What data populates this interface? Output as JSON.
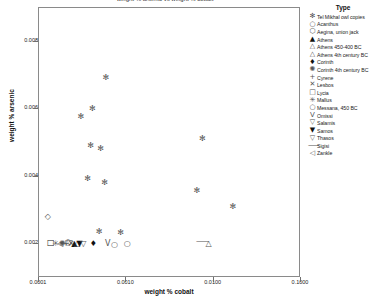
{
  "chart_data": {
    "type": "scatter",
    "title": "weight % arsenic vs weight % cobalt",
    "xlabel": "weight % cobalt",
    "ylabel": "weight % arsenic",
    "xscale": "log",
    "yscale": "linear",
    "xlim": [
      0.0001,
      0.1
    ],
    "ylim": [
      0.001,
      0.009
    ],
    "grid": false,
    "legend_position": "right",
    "legend_title": "Type",
    "xticks": [
      "0.0001",
      "0.0010",
      "0.0100",
      "0.1000"
    ],
    "xtick_values": [
      0.0001,
      0.001,
      0.01,
      0.1
    ],
    "yticks": [
      "0.008",
      "0.006",
      "0.004",
      "0.002"
    ],
    "ytick_values": [
      0.008,
      0.006,
      0.004,
      0.002
    ],
    "series": [
      {
        "name": "Tel Mikhal owl copies",
        "symbol": "✻",
        "dark": false,
        "points": [
          {
            "x": 0.0006,
            "y": 0.0069
          },
          {
            "x": 0.00042,
            "y": 0.006
          },
          {
            "x": 0.00031,
            "y": 0.00575
          },
          {
            "x": 0.0004,
            "y": 0.0049
          },
          {
            "x": 0.00052,
            "y": 0.0048
          },
          {
            "x": 0.00037,
            "y": 0.00392
          },
          {
            "x": 0.00058,
            "y": 0.0038
          },
          {
            "x": 0.0076,
            "y": 0.0051
          },
          {
            "x": 0.0066,
            "y": 0.00355
          },
          {
            "x": 0.017,
            "y": 0.0031
          },
          {
            "x": 0.0005,
            "y": 0.00235
          },
          {
            "x": 0.00088,
            "y": 0.00232
          }
        ]
      },
      {
        "name": "Acanthus",
        "symbol": "○",
        "dark": false,
        "points": [
          {
            "x": 0.00105,
            "y": 0.00198
          }
        ]
      },
      {
        "name": "Aegina, union jack",
        "symbol": "⬡",
        "dark": false,
        "points": [
          {
            "x": 0.00022,
            "y": 0.00201
          }
        ]
      },
      {
        "name": "Athens",
        "symbol": "▲",
        "dark": true,
        "points": [
          {
            "x": 0.00026,
            "y": 0.002
          }
        ]
      },
      {
        "name": "Athens 450-400 BC",
        "symbol": "△",
        "dark": false,
        "points": [
          {
            "x": 0.009,
            "y": 0.002
          }
        ]
      },
      {
        "name": "Athens 4th century BC",
        "symbol": "△",
        "dark": false,
        "points": [
          {
            "x": 0.00028,
            "y": 0.002
          }
        ]
      },
      {
        "name": "Corinth",
        "symbol": "♦",
        "dark": true,
        "points": [
          {
            "x": 0.00043,
            "y": 0.00199
          }
        ]
      },
      {
        "name": "Corinth 4th century BC",
        "symbol": "✺",
        "dark": false,
        "points": [
          {
            "x": 0.00019,
            "y": 0.002
          }
        ]
      },
      {
        "name": "Cyrene",
        "symbol": "+",
        "dark": false,
        "points": [
          {
            "x": 0.00021,
            "y": 0.00199
          }
        ]
      },
      {
        "name": "Lesbos",
        "symbol": "✕",
        "dark": false,
        "points": [
          {
            "x": 0.00024,
            "y": 0.002
          }
        ]
      },
      {
        "name": "Lycia",
        "symbol": "□",
        "dark": true,
        "points": [
          {
            "x": 0.00014,
            "y": 0.00201
          }
        ]
      },
      {
        "name": "Mallus",
        "symbol": "✳",
        "dark": false,
        "points": [
          {
            "x": 0.00016,
            "y": 0.002
          }
        ]
      },
      {
        "name": "Messana, 450 BC",
        "symbol": "○",
        "dark": false,
        "points": [
          {
            "x": 0.00075,
            "y": 0.00197
          }
        ]
      },
      {
        "name": "Omissi",
        "symbol": "Ⅴ",
        "dark": false,
        "points": [
          {
            "x": 0.00063,
            "y": 0.002
          }
        ]
      },
      {
        "name": "Salamis",
        "symbol": "▽",
        "dark": false,
        "points": [
          {
            "x": 0.00023,
            "y": 0.00202
          }
        ]
      },
      {
        "name": "Samos",
        "symbol": "▼",
        "dark": true,
        "points": [
          {
            "x": 0.0003,
            "y": 0.00199
          }
        ]
      },
      {
        "name": "Thasos",
        "symbol": "▽",
        "dark": false,
        "points": [
          {
            "x": 0.00033,
            "y": 0.002
          }
        ]
      },
      {
        "name": "Sigisi",
        "symbol": "⸺",
        "dark": false,
        "points": [
          {
            "x": 0.0072,
            "y": 0.00206
          }
        ]
      },
      {
        "name": "Zankle",
        "symbol": "◁",
        "dark": false,
        "points": [
          {
            "x": 0.00018,
            "y": 0.002
          }
        ]
      },
      {
        "name": "diamond-outlier",
        "symbol": "◇",
        "dark": false,
        "points": [
          {
            "x": 0.00013,
            "y": 0.0028
          }
        ]
      }
    ],
    "legend_entries": [
      {
        "label": "Tel Mikhal owl copies",
        "symbol": "✻",
        "dark": false
      },
      {
        "label": "Acanthus",
        "symbol": "○",
        "dark": false
      },
      {
        "label": "Aegina, union jack",
        "symbol": "⬡",
        "dark": false
      },
      {
        "label": "Athens",
        "symbol": "▲",
        "dark": true
      },
      {
        "label": "Athens 450-400 BC",
        "symbol": "△",
        "dark": false
      },
      {
        "label": "Athens 4th century BC",
        "symbol": "△",
        "dark": false
      },
      {
        "label": "Corinth",
        "symbol": "♦",
        "dark": true
      },
      {
        "label": "Corinth 4th century BC",
        "symbol": "✺",
        "dark": false
      },
      {
        "label": "Cyrene",
        "symbol": "+",
        "dark": false
      },
      {
        "label": "Lesbos",
        "symbol": "✕",
        "dark": false
      },
      {
        "label": "Lycia",
        "symbol": "□",
        "dark": false
      },
      {
        "label": "Mallus",
        "symbol": "✳",
        "dark": false
      },
      {
        "label": "Messana, 450 BC",
        "symbol": "○",
        "dark": false
      },
      {
        "label": "Omissi",
        "symbol": "Ⅴ",
        "dark": false
      },
      {
        "label": "Salamis",
        "symbol": "▽",
        "dark": false
      },
      {
        "label": "Samos",
        "symbol": "▼",
        "dark": true
      },
      {
        "label": "Thasos",
        "symbol": "▽",
        "dark": false
      },
      {
        "label": "Sigisi",
        "symbol": "⸺",
        "dark": false
      },
      {
        "label": "Zankle",
        "symbol": "◁",
        "dark": false
      }
    ]
  }
}
